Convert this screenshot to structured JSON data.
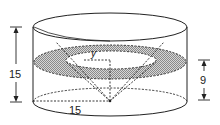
{
  "figure": {
    "labels": {
      "height": "15",
      "radius": "15",
      "section_height": "9",
      "inner_radius": "y"
    },
    "colors": {
      "stroke": "#222222",
      "shading": "#bdbdbd",
      "background": "#ffffff"
    }
  }
}
